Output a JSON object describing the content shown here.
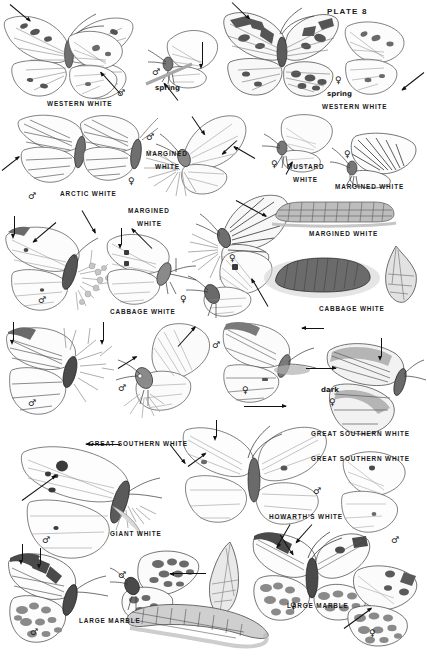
{
  "plate": {
    "number_label": "PLATE 8",
    "page_width": 427,
    "page_height": 672,
    "background_color": "#ffffff",
    "ink_color": "#1a1a1a"
  },
  "symbols": {
    "male": "♂",
    "female": "♀"
  },
  "species_labels": [
    {
      "id": "western-white-left",
      "text": "WESTERN WHITE",
      "x": 47,
      "y": 100
    },
    {
      "id": "western-white-right",
      "text": "WESTERN WHITE",
      "x": 322,
      "y": 103
    },
    {
      "id": "arctic-white",
      "text": "ARCTIC WHITE",
      "x": 60,
      "y": 190
    },
    {
      "id": "margined-white-center-top",
      "text": "MARGINED",
      "x": 146,
      "y": 150
    },
    {
      "id": "margined-white-center-top2",
      "text": "WHITE",
      "x": 155,
      "y": 163
    },
    {
      "id": "mustard-white-1",
      "text": "MUSTARD",
      "x": 287,
      "y": 163
    },
    {
      "id": "mustard-white-2",
      "text": "WHITE",
      "x": 293,
      "y": 176
    },
    {
      "id": "margined-white-right",
      "text": "MARGINED WHITE",
      "x": 335,
      "y": 183
    },
    {
      "id": "margined-white-center-2a",
      "text": "MARGINED",
      "x": 128,
      "y": 207
    },
    {
      "id": "margined-white-center-2b",
      "text": "WHITE",
      "x": 137,
      "y": 220
    },
    {
      "id": "margined-white-larva",
      "text": "MARGINED WHITE",
      "x": 309,
      "y": 230
    },
    {
      "id": "cabbage-white-left",
      "text": "CABBAGE WHITE",
      "x": 110,
      "y": 308
    },
    {
      "id": "cabbage-white-right",
      "text": "CABBAGE WHITE",
      "x": 319,
      "y": 305
    },
    {
      "id": "great-southern-white-r1",
      "text": "GREAT SOUTHERN WHITE",
      "x": 311,
      "y": 430
    },
    {
      "id": "great-southern-white-l",
      "text": "GREAT SOUTHERN WHITE",
      "x": 89,
      "y": 440
    },
    {
      "id": "great-southern-white-r2",
      "text": "GREAT SOUTHERN WHITE",
      "x": 311,
      "y": 455
    },
    {
      "id": "giant-white",
      "text": "GIANT WHITE",
      "x": 110,
      "y": 530
    },
    {
      "id": "howarths-white",
      "text": "HOWARTH'S WHITE",
      "x": 269,
      "y": 513
    },
    {
      "id": "large-marble-left",
      "text": "LARGE MARBLE",
      "x": 79,
      "y": 617
    },
    {
      "id": "large-marble-right",
      "text": "LARGE MARBLE",
      "x": 287,
      "y": 602
    }
  ],
  "form_labels": [
    {
      "id": "spring-left",
      "text": "spring",
      "x": 155,
      "y": 84
    },
    {
      "id": "spring-right",
      "text": "spring",
      "x": 327,
      "y": 90
    },
    {
      "id": "dark-form",
      "text": "dark",
      "x": 321,
      "y": 386
    }
  ],
  "sex_marks": [
    {
      "id": "ww-left-male",
      "sex": "male",
      "x": 117,
      "y": 89
    },
    {
      "id": "ww-spring-male",
      "sex": "male",
      "x": 152,
      "y": 68
    },
    {
      "id": "ww-right-female",
      "sex": "female",
      "x": 335,
      "y": 76
    },
    {
      "id": "arctic-male",
      "sex": "male",
      "x": 28,
      "y": 192
    },
    {
      "id": "arctic-female",
      "sex": "female",
      "x": 128,
      "y": 177
    },
    {
      "id": "margined-male",
      "sex": "male",
      "x": 146,
      "y": 133
    },
    {
      "id": "mustard-female",
      "sex": "female",
      "x": 271,
      "y": 160
    },
    {
      "id": "margined-r-female",
      "sex": "female",
      "x": 344,
      "y": 150
    },
    {
      "id": "margined-c2-female",
      "sex": "female",
      "x": 229,
      "y": 254
    },
    {
      "id": "cabbage-l-male",
      "sex": "male",
      "x": 38,
      "y": 296
    },
    {
      "id": "cabbage-c-female",
      "sex": "female",
      "x": 180,
      "y": 295
    },
    {
      "id": "cabbage-r-male",
      "sex": "male",
      "x": 212,
      "y": 341
    },
    {
      "id": "gsw-l-male",
      "sex": "male",
      "x": 28,
      "y": 399
    },
    {
      "id": "gsw-c-male",
      "sex": "male",
      "x": 118,
      "y": 384
    },
    {
      "id": "gsw-c2-female",
      "sex": "female",
      "x": 242,
      "y": 386
    },
    {
      "id": "gsw-dark-female",
      "sex": "female",
      "x": 329,
      "y": 398
    },
    {
      "id": "giant-white-male",
      "sex": "male",
      "x": 42,
      "y": 536
    },
    {
      "id": "howarth-male",
      "sex": "male",
      "x": 313,
      "y": 487
    },
    {
      "id": "howarth-r-male",
      "sex": "male",
      "x": 391,
      "y": 536
    },
    {
      "id": "marble-l-male",
      "sex": "male",
      "x": 30,
      "y": 628
    },
    {
      "id": "marble-c-male",
      "sex": "male",
      "x": 118,
      "y": 571
    },
    {
      "id": "marble-r-female",
      "sex": "female",
      "x": 290,
      "y": 602
    },
    {
      "id": "marble-r2-female",
      "sex": "female",
      "x": 369,
      "y": 629
    }
  ],
  "figure_captions": {
    "plate_subject": "butterfly field guide plate",
    "groups": [
      "Western White",
      "Arctic White",
      "Margined White",
      "Mustard White",
      "Cabbage White",
      "Great Southern White",
      "Giant White",
      "Howarth's White",
      "Large Marble"
    ]
  }
}
